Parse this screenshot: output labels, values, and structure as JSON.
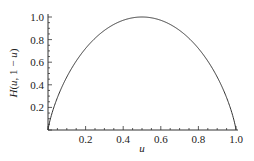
{
  "chart_data": {
    "type": "line",
    "title": "",
    "xlabel": "u",
    "ylabel": "H(u, 1 − u)",
    "xlim": [
      0,
      1.0
    ],
    "ylim": [
      0,
      1.0
    ],
    "grid": false,
    "legend": null,
    "x_ticks": [
      "0.2",
      "0.4",
      "0.6",
      "0.8",
      "1.0"
    ],
    "y_ticks": [
      "0.2",
      "0.4",
      "0.6",
      "0.8",
      "1.0"
    ],
    "series": [
      {
        "name": "H(u, 1 − u)",
        "x": [
          0,
          0.01,
          0.05,
          0.1,
          0.2,
          0.3,
          0.4,
          0.5,
          0.6,
          0.7,
          0.8,
          0.9,
          0.95,
          0.99,
          1.0
        ],
        "y": [
          0,
          0.081,
          0.286,
          0.469,
          0.722,
          0.881,
          0.971,
          1.0,
          0.971,
          0.881,
          0.722,
          0.469,
          0.286,
          0.081,
          0
        ]
      }
    ]
  },
  "labels": {
    "xlabel": "u",
    "ylabel_H": "H",
    "ylabel_open": "(",
    "ylabel_u": "u",
    "ylabel_rest": ", 1 − ",
    "ylabel_u2": "u",
    "ylabel_close": ")"
  }
}
